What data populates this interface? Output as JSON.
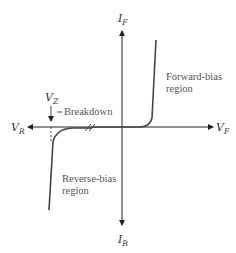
{
  "diagram": {
    "type": "diode-iv-characteristic",
    "axes": {
      "positive_y": {
        "symbol": "I",
        "subscript": "F"
      },
      "negative_y": {
        "symbol": "I",
        "subscript": "R"
      },
      "positive_x": {
        "symbol": "V",
        "subscript": "F"
      },
      "negative_x": {
        "symbol": "V",
        "subscript": "R"
      }
    },
    "annotations": {
      "zener_voltage": {
        "symbol": "V",
        "subscript": "Z"
      },
      "breakdown": "Breakdown",
      "forward_region": [
        "Forward-bias",
        "region"
      ],
      "reverse_region": [
        "Reverse-bias",
        "region"
      ]
    },
    "colors": {
      "axis": "#222222",
      "curve": "#444444",
      "text": "#555555"
    }
  }
}
